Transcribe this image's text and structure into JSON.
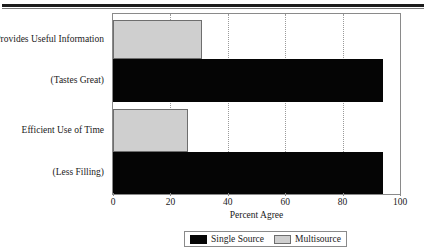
{
  "chart_data": {
    "type": "bar",
    "orientation": "horizontal",
    "title": "",
    "xlabel": "Percent Agree",
    "ylabel": "",
    "xlim": [
      0,
      100
    ],
    "xticks": [
      0,
      20,
      40,
      60,
      80,
      100
    ],
    "gridlines": [
      20,
      40,
      60,
      80
    ],
    "grid": true,
    "legend_position": "bottom",
    "categories": [
      "Provides Useful Information",
      "(Tastes Great)",
      "Efficient Use of Time",
      "(Less Filling)"
    ],
    "series": [
      {
        "name": "Single Source",
        "color": "#050505",
        "values": [
          null,
          94,
          null,
          94
        ]
      },
      {
        "name": "Multisource",
        "color": "#cfcfcf",
        "values": [
          31,
          null,
          26,
          null
        ]
      }
    ],
    "bars": [
      {
        "category": "Provides Useful Information",
        "series": "Multisource",
        "value": 31
      },
      {
        "category": "(Tastes Great)",
        "series": "Single Source",
        "value": 94
      },
      {
        "category": "Efficient Use of Time",
        "series": "Multisource",
        "value": 26
      },
      {
        "category": "(Less Filling)",
        "series": "Single Source",
        "value": 94
      }
    ]
  },
  "legend": {
    "items": [
      {
        "label": "Single Source",
        "color": "#050505"
      },
      {
        "label": "Multisource",
        "color": "#cfcfcf"
      }
    ]
  }
}
